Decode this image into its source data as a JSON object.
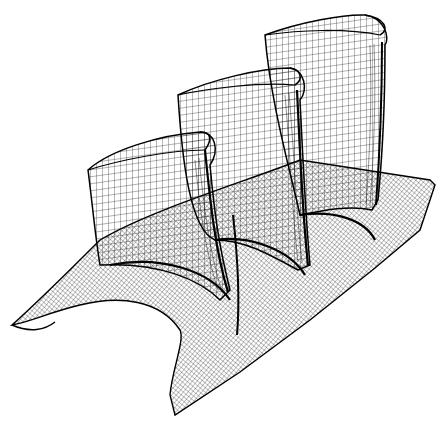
{
  "figure": {
    "background_color": "#ffffff",
    "line_color": "#111111",
    "blade_count": 3,
    "blades": [
      {
        "id": "blade-1",
        "position": "front-left"
      },
      {
        "id": "blade-2",
        "position": "middle"
      },
      {
        "id": "blade-3",
        "position": "back-right"
      }
    ],
    "hub": {
      "shape": "curved annular sector endwall"
    }
  }
}
